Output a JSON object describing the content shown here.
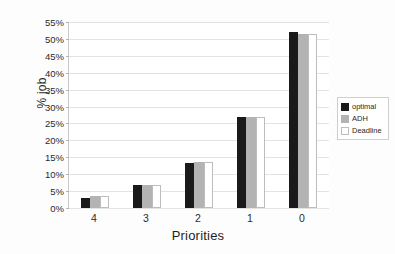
{
  "chart_data": {
    "type": "bar",
    "title": "",
    "xlabel": "Priorities",
    "ylabel": "% job",
    "categories": [
      "4",
      "3",
      "2",
      "1",
      "0"
    ],
    "series": [
      {
        "name": "optimal",
        "color": "#1a1a1a",
        "values": [
          3.0,
          6.7,
          13.2,
          27.0,
          52.0
        ]
      },
      {
        "name": "ADH",
        "color": "#b3b3b3",
        "values": [
          3.7,
          6.8,
          13.7,
          27.0,
          51.5
        ]
      },
      {
        "name": "Deadline",
        "color": "#ffffff",
        "values": [
          3.7,
          6.8,
          13.7,
          27.0,
          51.5
        ]
      }
    ],
    "ylim": [
      0,
      55
    ],
    "ytick_values": [
      0,
      5,
      10,
      15,
      20,
      25,
      30,
      35,
      40,
      45,
      50,
      55
    ],
    "ytick_labels": [
      "0%",
      "5%",
      "10%",
      "15%",
      "20%",
      "25%",
      "30%",
      "35%",
      "40%",
      "45%",
      "50%",
      "55%"
    ],
    "grid": "horizontal",
    "legend_position": "center-right",
    "background_color": "#ffffff",
    "gridline_color": "#e3e3e3",
    "axis_color": "#b9b9b9"
  },
  "legend": {
    "entries": [
      {
        "label": "optimal"
      },
      {
        "label": "ADH"
      },
      {
        "label": "Deadline"
      }
    ]
  }
}
